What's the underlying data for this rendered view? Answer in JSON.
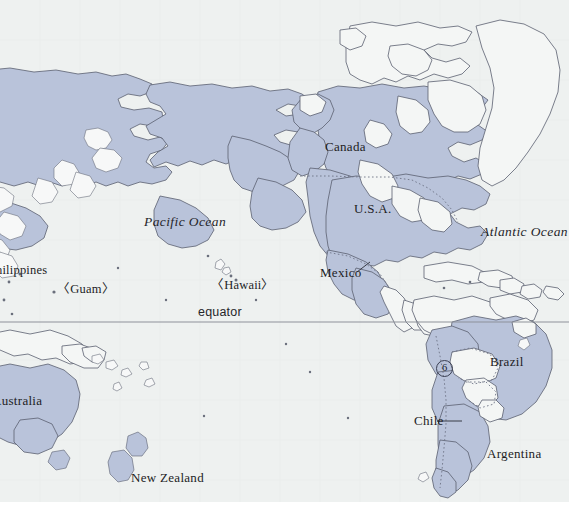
{
  "map": {
    "title": "Pacific Rim and Americas Reference Map",
    "projection_note": "Pacific-centred world map",
    "colors": {
      "ocean": "#eef1f0",
      "land_highlight": "#b9c3da",
      "land_plain": "#f4f6f5",
      "coastline": "#5b6070",
      "border_dotted": "#6e7487",
      "equator_line": "#8d9199",
      "frame": "#c9cdcc",
      "text": "#1d1d1f"
    },
    "equator": {
      "label": "equator",
      "x": 198,
      "y": 311
    },
    "oceans": [
      {
        "name": "Pacific Ocean",
        "x": 144,
        "y": 222
      },
      {
        "name": "Atlantic Ocean",
        "x": 481,
        "y": 232
      }
    ],
    "countries": [
      {
        "name": "Canada",
        "x": 325,
        "y": 146,
        "leader": false
      },
      {
        "name": "U.S.A.",
        "x": 354,
        "y": 208,
        "leader": false
      },
      {
        "name": "Mexico",
        "x": 320,
        "y": 272,
        "leader": true
      },
      {
        "name": "Brazil",
        "x": 490,
        "y": 361,
        "leader": false
      },
      {
        "name": "Chile",
        "x": 414,
        "y": 419,
        "leader": true
      },
      {
        "name": "Argentina",
        "x": 487,
        "y": 453,
        "leader": false
      },
      {
        "name": "Australia",
        "x": 0,
        "y": 400,
        "leader": false
      },
      {
        "name": "New Zealand",
        "x": 131,
        "y": 477,
        "leader": false
      }
    ],
    "islands": [
      {
        "name": "hilippines",
        "x": 0,
        "y": 269
      },
      {
        "name": "〈Guam〉",
        "x": 57,
        "y": 288
      },
      {
        "name": "〈Hawaii〉",
        "x": 211,
        "y": 284
      }
    ],
    "markers": [
      {
        "label": "6",
        "x": 436,
        "y": 360,
        "kind": "numbered-circle"
      }
    ]
  }
}
